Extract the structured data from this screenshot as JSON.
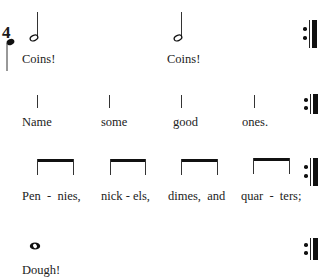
{
  "score": {
    "time_signature_top": "4",
    "repeat_sign": "end-repeat-barline",
    "rows": [
      {
        "name": "row-1",
        "notes": [
          "half-note",
          "half-note"
        ],
        "lyrics": [
          "Coins!",
          "Coins!"
        ]
      },
      {
        "name": "row-2",
        "notes": [
          "quarter-stem",
          "quarter-stem",
          "quarter-stem",
          "quarter-stem"
        ],
        "lyrics": [
          "Name",
          "some",
          "good",
          "ones."
        ]
      },
      {
        "name": "row-3",
        "notes": [
          "beamed-eighths",
          "beamed-eighths",
          "beamed-eighths",
          "beamed-eighths"
        ],
        "lyrics": [
          "Pen  -  nies,",
          "nick - els,",
          "dimes,  and",
          "quar  -  ters;"
        ]
      },
      {
        "name": "row-4",
        "notes": [
          "whole-note"
        ],
        "lyrics": [
          "Dough!"
        ]
      }
    ]
  }
}
